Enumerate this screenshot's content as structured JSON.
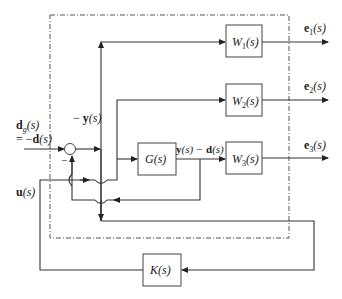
{
  "diagram": {
    "type": "block-diagram",
    "frame": "dash-dot generalized plant boundary",
    "blocks": {
      "W1": "W",
      "W1_sub": "1",
      "W2": "W",
      "W2_sub": "2",
      "W3": "W",
      "W3_sub": "3",
      "G": "G",
      "K": "K",
      "arg": "(s)"
    },
    "outputs": {
      "e1": "e",
      "e1_sub": "1",
      "e2": "e",
      "e2_sub": "2",
      "e3": "e",
      "e3_sub": "3",
      "arg": "(s)"
    },
    "inputs": {
      "dg_bold": "d",
      "dg_sub": "g",
      "dg_arg": "(s)",
      "dg_eq": "= −",
      "dg_eq_bold": "d",
      "dg_eq_arg": "(s)",
      "u_bold": "u",
      "u_arg": "(s)"
    },
    "signals": {
      "neg_y_prefix": "− ",
      "neg_y_bold": "y",
      "neg_y_arg": "(s)",
      "y_minus_d_y": "y",
      "y_minus_d_mid": "(s) − ",
      "y_minus_d_d": "d",
      "y_minus_d_arg": "(s)",
      "minus_sign": "−"
    }
  }
}
